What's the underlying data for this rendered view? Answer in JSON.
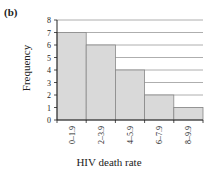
{
  "panel_label": "(b)",
  "chart_data": {
    "type": "bar",
    "title": "",
    "xlabel": "HIV death rate",
    "ylabel": "Frequency",
    "categories": [
      "0–1.9",
      "2–3.9",
      "4–5.9",
      "6–7.9",
      "8–9.9"
    ],
    "values": [
      7,
      6,
      4,
      2,
      1
    ],
    "ylim": [
      0,
      8
    ],
    "yticks": [
      0,
      1,
      2,
      3,
      4,
      5,
      6,
      7,
      8
    ],
    "grid": true,
    "bar_color": "#d9d9d9",
    "bar_edge_color": "#888888",
    "grid_color": "#999999"
  }
}
